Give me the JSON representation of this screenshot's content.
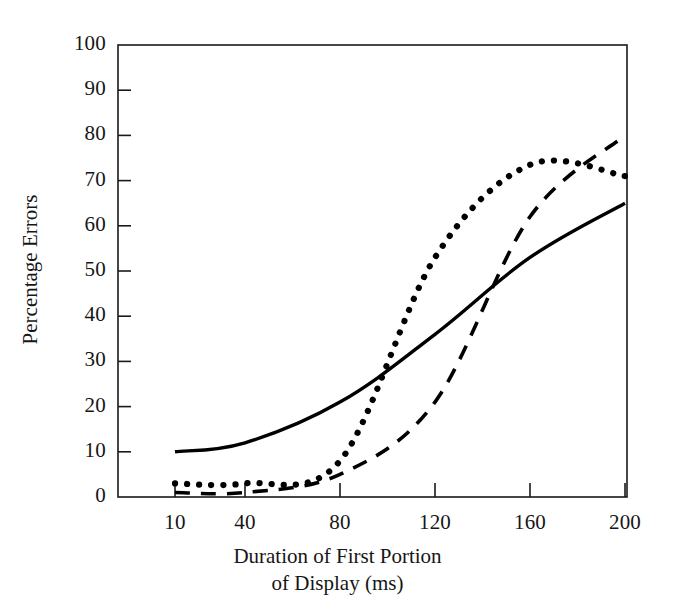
{
  "chart_data": {
    "type": "line",
    "title": "",
    "xlabel": "Duration of First Portion of Display (ms)",
    "xlabel_line1": "Duration of First Portion",
    "xlabel_line2": "of Display (ms)",
    "ylabel": "Percentage Errors",
    "xlim": [
      0,
      210
    ],
    "ylim": [
      0,
      100
    ],
    "xticks": [
      10,
      40,
      80,
      120,
      160,
      200
    ],
    "xtick_labels": [
      "10",
      "40",
      "80",
      "120",
      "160",
      "200"
    ],
    "yticks": [
      0,
      10,
      20,
      30,
      40,
      50,
      60,
      70,
      80,
      90,
      100
    ],
    "ytick_labels": [
      "0",
      "10",
      "20",
      "30",
      "40",
      "50",
      "60",
      "70",
      "80",
      "90",
      "100"
    ],
    "grid": false,
    "legend": "none",
    "frame": "box",
    "x": [
      10,
      40,
      80,
      120,
      160,
      200
    ],
    "series": [
      {
        "name": "solid",
        "style": "solid",
        "color": "#000000",
        "values": [
          10,
          12,
          21,
          36,
          53,
          65
        ]
      },
      {
        "name": "dotted",
        "style": "dotted",
        "color": "#000000",
        "values": [
          3,
          3,
          8,
          53,
          73.5,
          71
        ]
      },
      {
        "name": "dashed",
        "style": "dashed",
        "color": "#000000",
        "values": [
          1,
          1,
          5,
          21,
          62,
          80
        ]
      }
    ],
    "annotations": []
  }
}
